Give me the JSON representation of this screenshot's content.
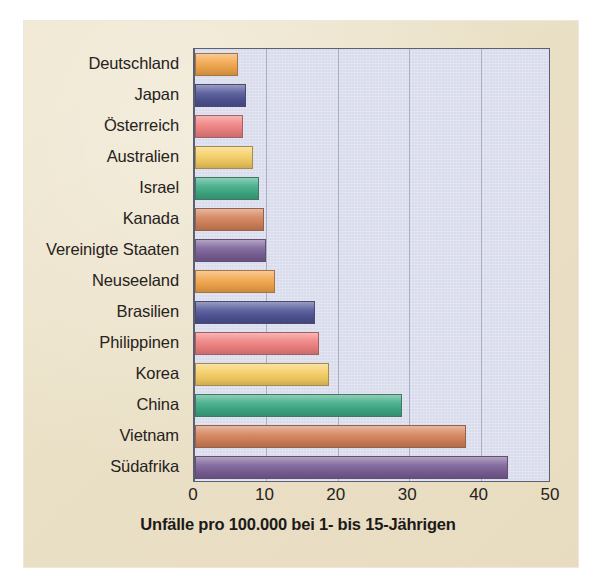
{
  "chart_data": {
    "type": "bar",
    "orientation": "horizontal",
    "title": "",
    "xlabel": "Unfälle pro 100.000 bei 1- bis 15-Jährigen",
    "ylabel": "",
    "xlim": [
      0,
      50
    ],
    "xticks": [
      "0",
      "10",
      "20",
      "30",
      "40",
      "50"
    ],
    "xtick_values": [
      0,
      10,
      20,
      30,
      40,
      50
    ],
    "grid": true,
    "grid_axis": "x",
    "legend": "none",
    "plot_background": "#d9dcec",
    "panel_background": "#eae0c6",
    "categories": [
      "Deutschland",
      "Japan",
      "Österreich",
      "Australien",
      "Israel",
      "Kanada",
      "Vereinigte Staaten",
      "Neuseeland",
      "Brasilien",
      "Philippinen",
      "Korea",
      "China",
      "Vietnam",
      "Südafrika"
    ],
    "values": [
      6,
      7.2,
      6.7,
      8.1,
      9,
      9.6,
      10,
      11.2,
      16.8,
      17.3,
      18.8,
      29,
      37.9,
      43.8
    ],
    "colors": [
      "#f3a54a",
      "#4f5496",
      "#f08080",
      "#f5cd62",
      "#3daa84",
      "#d4825a",
      "#7a6097",
      "#f3a54a",
      "#4f5496",
      "#f08080",
      "#f5cd62",
      "#3daa84",
      "#d4825a",
      "#7a6097"
    ]
  }
}
